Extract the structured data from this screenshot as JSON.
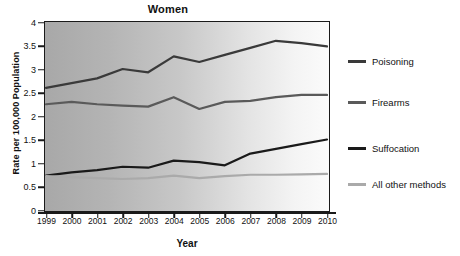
{
  "chart_data": {
    "type": "line",
    "title": "Women",
    "xlabel": "Year",
    "ylabel": "Rate per 100,000 Population",
    "grid": false,
    "legend_position": "right",
    "x": [
      1999,
      2000,
      2001,
      2002,
      2003,
      2004,
      2005,
      2006,
      2007,
      2008,
      2009,
      2010
    ],
    "xtick_labels": [
      "1999",
      "2000",
      "2001",
      "2002",
      "2003",
      "2004",
      "2005",
      "2006",
      "2007",
      "2008",
      "2009",
      "2010"
    ],
    "ytick_labels": [
      "0",
      "0.5",
      "1",
      "1.5",
      "2",
      "2.5",
      "3",
      "3.5",
      "4"
    ],
    "ytick_values": [
      0,
      0.5,
      1,
      1.5,
      2,
      2.5,
      3,
      3.5,
      4
    ],
    "ylim": [
      0,
      4
    ],
    "xlim": [
      1999,
      2010
    ],
    "series": [
      {
        "name": "Poisoning",
        "color": "#3a3a3a",
        "values": [
          2.6,
          2.7,
          2.8,
          3.0,
          2.93,
          3.27,
          3.15,
          3.3,
          3.45,
          3.6,
          3.55,
          3.48
        ]
      },
      {
        "name": "Firearms",
        "color": "#5a5a5a",
        "values": [
          2.25,
          2.3,
          2.25,
          2.22,
          2.2,
          2.4,
          2.15,
          2.3,
          2.32,
          2.4,
          2.45,
          2.45
        ]
      },
      {
        "name": "Suffocation",
        "color": "#1a1a1a",
        "values": [
          0.73,
          0.8,
          0.85,
          0.92,
          0.9,
          1.05,
          1.02,
          0.95,
          1.2,
          1.3,
          1.4,
          1.5
        ]
      },
      {
        "name": "All other methods",
        "color": "#aaaaaa",
        "values": [
          0.72,
          0.7,
          0.68,
          0.66,
          0.68,
          0.73,
          0.68,
          0.72,
          0.75,
          0.75,
          0.76,
          0.77
        ]
      }
    ]
  },
  "legend": {
    "items": [
      {
        "label": "Poisoning"
      },
      {
        "label": "Firearms"
      },
      {
        "label": "Suffocation"
      },
      {
        "label": "All other methods"
      }
    ]
  }
}
